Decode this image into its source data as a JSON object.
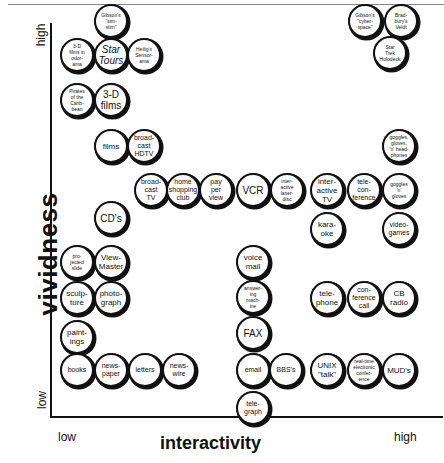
{
  "chart_data": {
    "type": "scatter",
    "title": "",
    "xlabel": "interactivity",
    "ylabel": "vividness",
    "x_ticks": [
      "low",
      "high"
    ],
    "y_ticks": [
      "low",
      "high"
    ],
    "points": [
      {
        "label": "Gibson's \"sim-stim\"",
        "x": 111,
        "y": 21
      },
      {
        "label": "3-D films in odor-ama",
        "x": 77,
        "y": 55
      },
      {
        "label": "Star Tours",
        "x": 111,
        "y": 55
      },
      {
        "label": "Heilig's Sensor-ama",
        "x": 144,
        "y": 55
      },
      {
        "label": "Pirates of the Carib-bean",
        "x": 77,
        "y": 100
      },
      {
        "label": "3-D films",
        "x": 111,
        "y": 100
      },
      {
        "label": "films",
        "x": 111,
        "y": 146
      },
      {
        "label": "broad-cast HDTV",
        "x": 144,
        "y": 146
      },
      {
        "label": "broad-cast TV",
        "x": 151,
        "y": 190
      },
      {
        "label": "home shopping club",
        "x": 183,
        "y": 190
      },
      {
        "label": "pay per view",
        "x": 216,
        "y": 190
      },
      {
        "label": "VCR",
        "x": 253,
        "y": 190
      },
      {
        "label": "inter-active laser-disc",
        "x": 287,
        "y": 190
      },
      {
        "label": "inter-active TV",
        "x": 327,
        "y": 190
      },
      {
        "label": "tele-con-ference",
        "x": 364,
        "y": 190
      },
      {
        "label": "goggles 'n' gloves",
        "x": 399,
        "y": 190
      },
      {
        "label": "goggles, gloves, 'n' head-phones",
        "x": 399,
        "y": 146
      },
      {
        "label": "kara-oke",
        "x": 327,
        "y": 229
      },
      {
        "label": "video-games",
        "x": 399,
        "y": 229
      },
      {
        "label": "Gibson's \"cyber-space\"",
        "x": 365,
        "y": 21
      },
      {
        "label": "Brad-bury's Veldt",
        "x": 401,
        "y": 21
      },
      {
        "label": "Star Trek Holodeck",
        "x": 390,
        "y": 53
      },
      {
        "label": "CD's",
        "x": 111,
        "y": 218
      },
      {
        "label": "pro-jected slide",
        "x": 77,
        "y": 262
      },
      {
        "label": "View-Master",
        "x": 111,
        "y": 262
      },
      {
        "label": "sculp-ture",
        "x": 77,
        "y": 298
      },
      {
        "label": "photo-graph",
        "x": 111,
        "y": 298
      },
      {
        "label": "paint-ings",
        "x": 77,
        "y": 337
      },
      {
        "label": "books",
        "x": 77,
        "y": 370
      },
      {
        "label": "news-paper",
        "x": 111,
        "y": 370
      },
      {
        "label": "letters",
        "x": 145,
        "y": 370
      },
      {
        "label": "news-wire",
        "x": 179,
        "y": 370
      },
      {
        "label": "voice mail",
        "x": 253,
        "y": 262
      },
      {
        "label": "answer-ing mach-ine",
        "x": 253,
        "y": 297
      },
      {
        "label": "FAX",
        "x": 253,
        "y": 333
      },
      {
        "label": "tele-phone",
        "x": 327,
        "y": 298
      },
      {
        "label": "con-ference call",
        "x": 364,
        "y": 298
      },
      {
        "label": "CB radio",
        "x": 399,
        "y": 298
      },
      {
        "label": "email",
        "x": 253,
        "y": 370
      },
      {
        "label": "BBS's",
        "x": 286,
        "y": 370
      },
      {
        "label": "UNIX \"talk\"",
        "x": 327,
        "y": 370
      },
      {
        "label": "real-time electronic confer-ence",
        "x": 364,
        "y": 370
      },
      {
        "label": "MUD's",
        "x": 399,
        "y": 370
      },
      {
        "label": "tele-graph",
        "x": 253,
        "y": 408
      }
    ]
  },
  "axes": {
    "y_title": "vividness",
    "y_high": "high",
    "y_low": "low",
    "x_title": "interactivity",
    "x_low": "low",
    "x_high": "high"
  },
  "nodes": [
    {
      "text": "Gibson's\n\"sim-\nstim\"",
      "x": 111,
      "y": 21,
      "size": "xs"
    },
    {
      "text": "3-D\nfilms in\nodor-\nama",
      "x": 77,
      "y": 55,
      "size": "xs"
    },
    {
      "text": "Star\nTours",
      "x": 111,
      "y": 55,
      "size": "it"
    },
    {
      "text": "Heilig's\nSensor-\nama",
      "x": 144,
      "y": 55,
      "size": "xs"
    },
    {
      "text": "Pirates\nof the\nCarib-\nbean",
      "x": 77,
      "y": 100,
      "size": "xs"
    },
    {
      "text": "3-D\nfilms",
      "x": 111,
      "y": 100,
      "size": "lg"
    },
    {
      "text": "films",
      "x": 111,
      "y": 146,
      "size": "md"
    },
    {
      "text": "broad-\ncast\nHDTV",
      "x": 144,
      "y": 146,
      "size": "sm"
    },
    {
      "text": "broad-\ncast\nTV",
      "x": 151,
      "y": 190,
      "size": "sm"
    },
    {
      "text": "home\nshopping\nclub",
      "x": 183,
      "y": 190,
      "size": "sm"
    },
    {
      "text": "pay\nper\nview",
      "x": 216,
      "y": 190,
      "size": "sm"
    },
    {
      "text": "VCR",
      "x": 253,
      "y": 190,
      "size": "lg"
    },
    {
      "text": "inter-\nactive\nlaser-\ndisc",
      "x": 287,
      "y": 190,
      "size": "xs"
    },
    {
      "text": "inter-\nactive\nTV",
      "x": 327,
      "y": 190,
      "size": "md"
    },
    {
      "text": "tele-\ncon-\nference",
      "x": 364,
      "y": 190,
      "size": "sm"
    },
    {
      "text": "goggles\n'n'\ngloves",
      "x": 399,
      "y": 190,
      "size": "xs"
    },
    {
      "text": "goggles,\ngloves,\n'n' head-\nphones",
      "x": 399,
      "y": 146,
      "size": "xs"
    },
    {
      "text": "kara-\noke",
      "x": 327,
      "y": 229,
      "size": "md"
    },
    {
      "text": "video-\ngames",
      "x": 399,
      "y": 229,
      "size": "sm"
    },
    {
      "text": "Gibson's\n\"cyber-\nspace\"",
      "x": 365,
      "y": 21,
      "size": "xs"
    },
    {
      "text": "Brad-\nbury's\nVeldt",
      "x": 401,
      "y": 21,
      "size": "xs"
    },
    {
      "text": "Star\nTrek\nHolodeck",
      "x": 390,
      "y": 53,
      "size": "xs"
    },
    {
      "text": "CD's",
      "x": 111,
      "y": 218,
      "size": "lg"
    },
    {
      "text": "pro-\njected\nslide",
      "x": 77,
      "y": 262,
      "size": "xs"
    },
    {
      "text": "View-\nMaster",
      "x": 111,
      "y": 262,
      "size": "md"
    },
    {
      "text": "sculp-\nture",
      "x": 77,
      "y": 298,
      "size": "md"
    },
    {
      "text": "photo-\ngraph",
      "x": 111,
      "y": 298,
      "size": "md"
    },
    {
      "text": "paint-\nings",
      "x": 77,
      "y": 337,
      "size": "md"
    },
    {
      "text": "books",
      "x": 77,
      "y": 370,
      "size": "sm"
    },
    {
      "text": "news-\npaper",
      "x": 111,
      "y": 370,
      "size": "sm"
    },
    {
      "text": "letters",
      "x": 145,
      "y": 370,
      "size": "sm"
    },
    {
      "text": "news-\nwire",
      "x": 179,
      "y": 370,
      "size": "sm"
    },
    {
      "text": "voice\nmail",
      "x": 253,
      "y": 262,
      "size": "md"
    },
    {
      "text": "answer-\ning\nmach-\nine",
      "x": 253,
      "y": 297,
      "size": "xs"
    },
    {
      "text": "FAX",
      "x": 253,
      "y": 333,
      "size": "lg"
    },
    {
      "text": "tele-\nphone",
      "x": 327,
      "y": 298,
      "size": "md"
    },
    {
      "text": "con-\nference\ncall",
      "x": 364,
      "y": 298,
      "size": "sm"
    },
    {
      "text": "CB\nradio",
      "x": 399,
      "y": 298,
      "size": "md"
    },
    {
      "text": "email",
      "x": 253,
      "y": 370,
      "size": "sm"
    },
    {
      "text": "BBS's",
      "x": 286,
      "y": 370,
      "size": "sm"
    },
    {
      "text": "UNIX\n\"talk\"",
      "x": 327,
      "y": 370,
      "size": "md"
    },
    {
      "text": "real-time\nelectronic\nconfer-\nence",
      "x": 364,
      "y": 370,
      "size": "xs"
    },
    {
      "text": "MUD's",
      "x": 399,
      "y": 370,
      "size": "md"
    },
    {
      "text": "tele-\ngraph",
      "x": 253,
      "y": 408,
      "size": "sm"
    }
  ]
}
